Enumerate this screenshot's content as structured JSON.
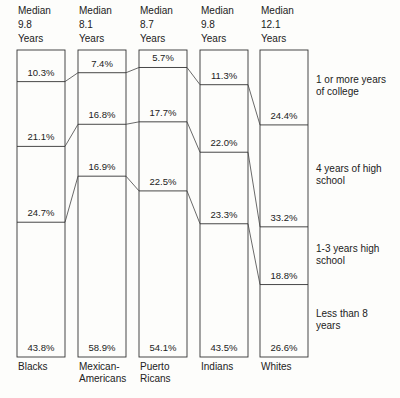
{
  "chart_data": {
    "type": "bar",
    "stacked": true,
    "title": "",
    "xlabel": "",
    "ylabel": "",
    "ylim": [
      0,
      100
    ],
    "categories": [
      "Blacks",
      "Mexican-Americans",
      "Puerto Ricans",
      "Indians",
      "Whites"
    ],
    "category_labels": [
      [
        "Blacks"
      ],
      [
        "Mexican-",
        "Americans"
      ],
      [
        "Puerto",
        "Ricans"
      ],
      [
        "Indians"
      ],
      [
        "Whites"
      ]
    ],
    "medians": [
      [
        "Median",
        "9.8",
        "Years"
      ],
      [
        "Median",
        "8.1",
        "Years"
      ],
      [
        "Median",
        "8.7",
        "Years"
      ],
      [
        "Median",
        "9.8",
        "Years"
      ],
      [
        "Median",
        "12.1",
        "Years"
      ]
    ],
    "series": [
      {
        "name": "1 or more years of college",
        "values": [
          10.3,
          7.4,
          5.7,
          11.3,
          24.4
        ],
        "labels": [
          "10.3%",
          "7.4%",
          "5.7%",
          "11.3%",
          "24.4%"
        ]
      },
      {
        "name": "4 years of high school",
        "values": [
          21.1,
          16.8,
          17.7,
          22.0,
          33.2
        ],
        "labels": [
          "21.1%",
          "16.8%",
          "17.7%",
          "22.0%",
          "33.2%"
        ]
      },
      {
        "name": "1-3 years high school",
        "values": [
          24.7,
          16.9,
          22.5,
          23.3,
          18.8
        ],
        "labels": [
          "24.7%",
          "16.9%",
          "22.5%",
          "23.3%",
          "18.8%"
        ]
      },
      {
        "name": "Less than 8 years",
        "values": [
          43.8,
          58.9,
          54.1,
          43.5,
          26.6
        ],
        "labels": [
          "43.8%",
          "58.9%",
          "54.1%",
          "43.5%",
          "26.6%"
        ]
      }
    ],
    "legend": [
      [
        "1 or more years",
        "of college"
      ],
      [
        "4 years of high",
        "school"
      ],
      [
        "1-3 years high",
        "school"
      ],
      [
        "Less than 8",
        "years"
      ]
    ],
    "legend_position": "right",
    "grid": false
  }
}
